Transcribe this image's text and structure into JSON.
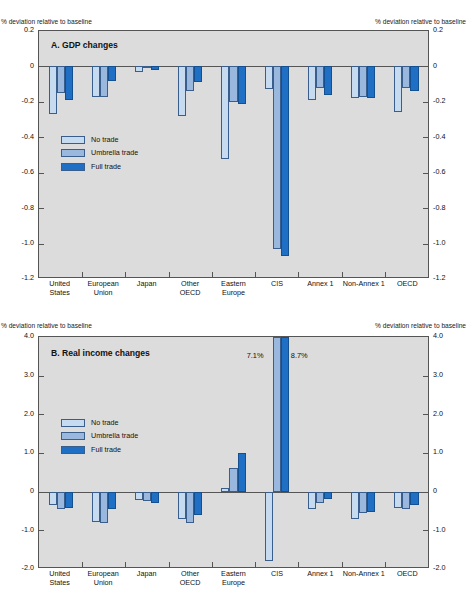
{
  "figure": {
    "top_partial_text": "",
    "series_colors": {
      "no_trade": "#c6dbef",
      "umbrella_trade": "#9ab8dd",
      "full_trade": "#1f6fc4"
    },
    "plot_background": "#dcdcdc",
    "axis_caption_left": "% deviation relative to baseline",
    "axis_caption_right": "% deviation relative to baseline",
    "legend": [
      {
        "label": "No trade",
        "color": "#c6dbef"
      },
      {
        "label": "Umbrella trade",
        "color": "#9ab8dd"
      },
      {
        "label": "Full trade",
        "color": "#1f6fc4"
      }
    ],
    "categories": [
      {
        "line1": "United",
        "line2": "States"
      },
      {
        "line1": "European",
        "line2": "Union"
      },
      {
        "line1": "Japan",
        "line2": ""
      },
      {
        "line1": "Other",
        "line2": "OECD"
      },
      {
        "line1": "Eastern",
        "line2": "Europe"
      },
      {
        "line1": "CIS",
        "line2": ""
      },
      {
        "line1": "Annex 1",
        "line2": ""
      },
      {
        "line1": "Non-Annex 1",
        "line2": ""
      },
      {
        "line1": "OECD",
        "line2": ""
      }
    ]
  },
  "chart_data": [
    {
      "type": "bar",
      "panel": "A",
      "title": "A.  GDP changes",
      "xlabel": "",
      "ylabel": "% deviation relative to baseline",
      "ylim": [
        -1.2,
        0.2
      ],
      "yticks": [
        "0.2",
        "0",
        "-0.2",
        "-0.4",
        "-0.6",
        "-0.8",
        "-1.0",
        "-1.2"
      ],
      "ytick_values": [
        0.2,
        0,
        -0.2,
        -0.4,
        -0.6,
        -0.8,
        -1.0,
        -1.2
      ],
      "grid": false,
      "legend_position": "inside-left",
      "categories": [
        "United States",
        "European Union",
        "Japan",
        "Other OECD",
        "Eastern Europe",
        "CIS",
        "Annex 1",
        "Non-Annex 1",
        "OECD"
      ],
      "series": [
        {
          "name": "No trade",
          "values": [
            -0.27,
            -0.17,
            -0.03,
            -0.28,
            -0.52,
            -0.13,
            -0.19,
            -0.18,
            -0.26
          ]
        },
        {
          "name": "Umbrella trade",
          "values": [
            -0.15,
            -0.17,
            -0.01,
            -0.14,
            -0.2,
            -1.03,
            -0.12,
            -0.17,
            -0.12
          ]
        },
        {
          "name": "Full trade",
          "values": [
            -0.19,
            -0.08,
            -0.02,
            -0.09,
            -0.21,
            -1.07,
            -0.16,
            -0.18,
            -0.14
          ]
        }
      ]
    },
    {
      "type": "bar",
      "panel": "B",
      "title": "B.  Real income changes",
      "xlabel": "",
      "ylabel": "% deviation relative to baseline",
      "ylim": [
        -2.0,
        4.0
      ],
      "yticks": [
        "4.0",
        "3.0",
        "2.0",
        "1.0",
        "0",
        "-1.0",
        "-2.0"
      ],
      "ytick_values": [
        4.0,
        3.0,
        2.0,
        1.0,
        0,
        -1.0,
        -2.0
      ],
      "grid": false,
      "legend_position": "inside-left",
      "categories": [
        "United States",
        "European Union",
        "Japan",
        "Other OECD",
        "Eastern Europe",
        "CIS",
        "Annex 1",
        "Non-Annex 1",
        "OECD"
      ],
      "series": [
        {
          "name": "No trade",
          "values": [
            -0.35,
            -0.78,
            -0.22,
            -0.72,
            0.1,
            -1.8,
            -0.45,
            -0.72,
            -0.42
          ]
        },
        {
          "name": "Umbrella trade",
          "values": [
            -0.45,
            -0.8,
            -0.25,
            -0.8,
            0.62,
            7.1,
            -0.3,
            -0.55,
            -0.45
          ]
        },
        {
          "name": "Full trade",
          "values": [
            -0.42,
            -0.45,
            -0.3,
            -0.6,
            1.0,
            8.7,
            -0.2,
            -0.52,
            -0.35
          ]
        }
      ],
      "annotations": [
        {
          "text": "7.1%",
          "category": "CIS",
          "series": "Umbrella trade"
        },
        {
          "text": "8.7%",
          "category": "CIS",
          "series": "Full trade"
        }
      ]
    }
  ]
}
